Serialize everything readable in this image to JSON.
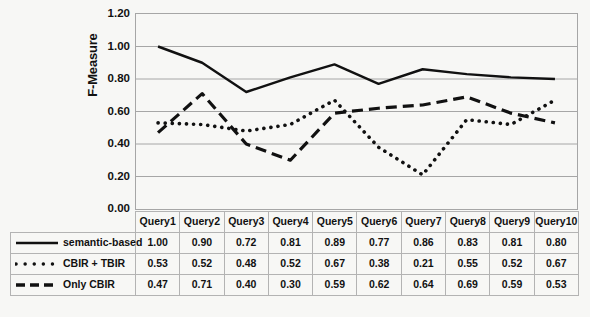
{
  "chart_data": {
    "type": "line",
    "title": "",
    "xlabel": "",
    "ylabel": "F-Measure",
    "ylim": [
      0.0,
      1.2
    ],
    "ytick_labels": [
      "1.20",
      "1.00",
      "0.80",
      "0.60",
      "0.40",
      "0.20",
      "0.00"
    ],
    "ytick_values": [
      1.2,
      1.0,
      0.8,
      0.6,
      0.4,
      0.2,
      0.0
    ],
    "grid": true,
    "legend_position": "table-left-column",
    "categories": [
      "Query1",
      "Query2",
      "Query3",
      "Query4",
      "Query5",
      "Query6",
      "Query7",
      "Query8",
      "Query9",
      "Query10"
    ],
    "category_display": [
      "Query1",
      "Query2",
      "Query3",
      "Query4",
      "Query5",
      "Query6",
      "Query7",
      "Query8",
      "Query9",
      "Query1\n0"
    ],
    "series": [
      {
        "name": "semantic-based",
        "style": "solid",
        "color": "#111111",
        "values": [
          1.0,
          0.9,
          0.72,
          0.81,
          0.89,
          0.77,
          0.86,
          0.83,
          0.81,
          0.8
        ],
        "values_text": [
          "1.00",
          "0.90",
          "0.72",
          "0.81",
          "0.89",
          "0.77",
          "0.86",
          "0.83",
          "0.81",
          "0.80"
        ]
      },
      {
        "name": "CBIR + TBIR",
        "style": "dotted",
        "color": "#111111",
        "values": [
          0.53,
          0.52,
          0.48,
          0.52,
          0.67,
          0.38,
          0.21,
          0.55,
          0.52,
          0.67
        ],
        "values_text": [
          "0.53",
          "0.52",
          "0.48",
          "0.52",
          "0.67",
          "0.38",
          "0.21",
          "0.55",
          "0.52",
          "0.67"
        ]
      },
      {
        "name": "Only CBIR",
        "style": "dashed",
        "color": "#111111",
        "values": [
          0.47,
          0.71,
          0.4,
          0.3,
          0.59,
          0.62,
          0.64,
          0.69,
          0.59,
          0.53
        ],
        "values_text": [
          "0.47",
          "0.71",
          "0.40",
          "0.30",
          "0.59",
          "0.62",
          "0.64",
          "0.69",
          "0.59",
          "0.53"
        ]
      }
    ]
  },
  "axis": {
    "y_title": "F-Measure"
  },
  "table": {
    "header_corner": "",
    "columns": [
      "Query1",
      "Query2",
      "Query3",
      "Query4",
      "Query5",
      "Query6",
      "Query7",
      "Query8",
      "Query9",
      "Query10"
    ],
    "rows": [
      {
        "label": "semantic-based",
        "swatch": "solid-line-swatch",
        "values": [
          "1.00",
          "0.90",
          "0.72",
          "0.81",
          "0.89",
          "0.77",
          "0.86",
          "0.83",
          "0.81",
          "0.80"
        ]
      },
      {
        "label": "CBIR + TBIR",
        "swatch": "dotted-line-swatch",
        "values": [
          "0.53",
          "0.52",
          "0.48",
          "0.52",
          "0.67",
          "0.38",
          "0.21",
          "0.55",
          "0.52",
          "0.67"
        ]
      },
      {
        "label": "Only CBIR",
        "swatch": "dashed-line-swatch",
        "values": [
          "0.47",
          "0.71",
          "0.40",
          "0.30",
          "0.59",
          "0.62",
          "0.64",
          "0.69",
          "0.59",
          "0.53"
        ]
      }
    ]
  },
  "colors": {
    "ink": "#111111",
    "gridline": "#a6a6a6",
    "table_border": "#b3b3b3",
    "background": "#f7f7f5"
  }
}
